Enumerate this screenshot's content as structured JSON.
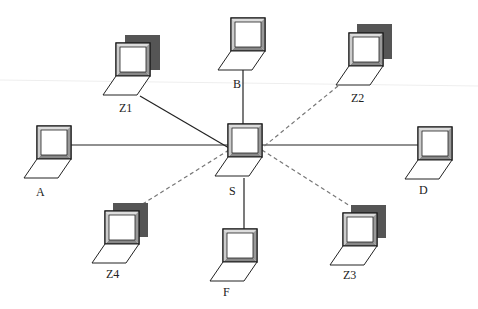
{
  "diagram": {
    "type": "star-network-topology",
    "center": "S",
    "nodes": [
      {
        "id": "S",
        "label": "S",
        "role": "center",
        "has_shadow": false
      },
      {
        "id": "A",
        "label": "A",
        "role": "leaf",
        "has_shadow": false
      },
      {
        "id": "B",
        "label": "B",
        "role": "leaf",
        "has_shadow": false
      },
      {
        "id": "D",
        "label": "D",
        "role": "leaf",
        "has_shadow": false
      },
      {
        "id": "F",
        "label": "F",
        "role": "leaf",
        "has_shadow": false
      },
      {
        "id": "Z1",
        "label": "Z1",
        "role": "leaf",
        "has_shadow": true
      },
      {
        "id": "Z2",
        "label": "Z2",
        "role": "leaf",
        "has_shadow": true
      },
      {
        "id": "Z3",
        "label": "Z3",
        "role": "leaf",
        "has_shadow": true
      },
      {
        "id": "Z4",
        "label": "Z4",
        "role": "leaf",
        "has_shadow": true
      }
    ],
    "edges": [
      {
        "from": "S",
        "to": "A",
        "style": "solid"
      },
      {
        "from": "S",
        "to": "B",
        "style": "solid"
      },
      {
        "from": "S",
        "to": "D",
        "style": "solid"
      },
      {
        "from": "S",
        "to": "F",
        "style": "solid"
      },
      {
        "from": "S",
        "to": "Z1",
        "style": "solid"
      },
      {
        "from": "S",
        "to": "Z2",
        "style": "dashed"
      },
      {
        "from": "S",
        "to": "Z3",
        "style": "dashed"
      },
      {
        "from": "S",
        "to": "Z4",
        "style": "dashed"
      }
    ],
    "labels": {
      "S": "S",
      "A": "A",
      "B": "B",
      "D": "D",
      "F": "F",
      "Z1": "Z1",
      "Z2": "Z2",
      "Z3": "Z3",
      "Z4": "Z4"
    },
    "colors": {
      "line": "#222222",
      "dashed_line": "#777777",
      "shadow": "#555555",
      "screen_bevel": "#bbbbbb",
      "background": "#ffffff"
    },
    "icon": "laptop-icon"
  }
}
